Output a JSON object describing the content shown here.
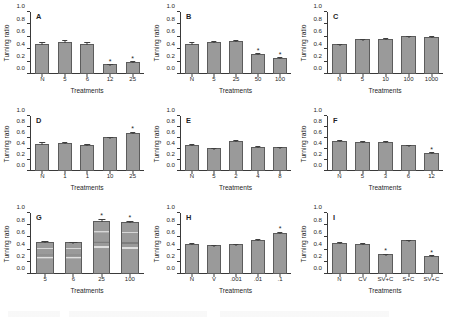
{
  "figure": {
    "y_axis_label": "Turning ratio",
    "x_axis_label": "Treatments",
    "y_ticks": [
      "0.0",
      "0.2",
      "0.4",
      "0.6",
      "0.8",
      "1.0"
    ],
    "bar_color": "#9a9a9a",
    "bar_edge_color": "#5c5c5c",
    "significance_marker": "*"
  },
  "chart_data": [
    {
      "type": "bar",
      "title": "A",
      "xlabel": "Treatments",
      "ylabel": "Turning ratio",
      "ylim": [
        0,
        1.0
      ],
      "grid": false,
      "categories": [
        "N",
        "5",
        "6",
        "12",
        "25"
      ],
      "values": [
        0.49,
        0.52,
        0.49,
        0.16,
        0.2
      ],
      "errors": [
        0.06,
        0.06,
        0.07,
        0.05,
        0.05
      ],
      "significant": [
        false,
        false,
        false,
        true,
        true
      ]
    },
    {
      "type": "bar",
      "title": "B",
      "xlabel": "Treatments",
      "ylabel": "Turning ratio",
      "ylim": [
        0,
        1.0
      ],
      "grid": false,
      "categories": [
        "N",
        "5",
        "25",
        "50",
        "100"
      ],
      "values": [
        0.49,
        0.51,
        0.53,
        0.32,
        0.26
      ],
      "errors": [
        0.05,
        0.04,
        0.05,
        0.04,
        0.05
      ],
      "significant": [
        false,
        false,
        false,
        true,
        true
      ]
    },
    {
      "type": "bar",
      "title": "C",
      "xlabel": "Treatments",
      "ylabel": "Turning ratio",
      "ylim": [
        0,
        1.0
      ],
      "grid": false,
      "categories": [
        "N",
        "5",
        "10",
        "100",
        "1000"
      ],
      "values": [
        0.48,
        0.56,
        0.57,
        0.61,
        0.6
      ],
      "errors": [
        0.01,
        0.02,
        0.02,
        0.01,
        0.01
      ],
      "significant": [
        false,
        false,
        false,
        false,
        false
      ]
    },
    {
      "type": "bar",
      "title": "D",
      "xlabel": "Treatments",
      "ylabel": "Turning ratio",
      "ylim": [
        0,
        1.0
      ],
      "grid": false,
      "categories": [
        "N",
        "1",
        "1",
        "10",
        "25"
      ],
      "values": [
        0.5,
        0.51,
        0.47,
        0.61,
        0.69
      ],
      "errors": [
        0.04,
        0.04,
        0.03,
        0.03,
        0.04
      ],
      "significant": [
        false,
        false,
        false,
        false,
        true
      ]
    },
    {
      "type": "bar",
      "title": "E",
      "xlabel": "Treatments",
      "ylabel": "Turning ratio",
      "ylim": [
        0,
        1.0
      ],
      "grid": false,
      "categories": [
        "N",
        "5",
        "2",
        "4",
        "8"
      ],
      "values": [
        0.48,
        0.42,
        0.55,
        0.44,
        0.43
      ],
      "errors": [
        0.02,
        0.01,
        0.02,
        0.02,
        0.01
      ],
      "significant": [
        false,
        false,
        false,
        false,
        false
      ]
    },
    {
      "type": "bar",
      "title": "F",
      "xlabel": "Treatments",
      "ylabel": "Turning ratio",
      "ylim": [
        0,
        1.0
      ],
      "grid": false,
      "categories": [
        "N",
        "5",
        "3",
        "6",
        "12"
      ],
      "values": [
        0.55,
        0.53,
        0.53,
        0.47,
        0.33
      ],
      "errors": [
        0.03,
        0.02,
        0.02,
        0.02,
        0.04
      ],
      "significant": [
        false,
        false,
        false,
        false,
        true
      ]
    },
    {
      "type": "bar",
      "title": "G",
      "xlabel": "Treatments",
      "ylabel": "Turning ratio",
      "ylim": [
        0,
        1.0
      ],
      "grid": false,
      "categories": [
        "5",
        "6",
        "25",
        "100"
      ],
      "values": [
        0.53,
        0.52,
        0.87,
        0.85
      ],
      "errors": [
        0.02,
        0.02,
        0.03,
        0.03
      ],
      "significant": [
        false,
        false,
        true,
        true
      ]
    },
    {
      "type": "bar",
      "title": "H",
      "xlabel": "Treatments",
      "ylabel": "Turning ratio",
      "ylim": [
        0,
        1.0
      ],
      "grid": false,
      "categories": [
        "N",
        "V",
        ".001",
        ".01",
        ".1"
      ],
      "values": [
        0.49,
        0.47,
        0.49,
        0.55,
        0.67
      ],
      "errors": [
        0.04,
        0.02,
        0.02,
        0.04,
        0.04
      ],
      "significant": [
        false,
        false,
        false,
        false,
        true
      ]
    },
    {
      "type": "bar",
      "title": "I",
      "xlabel": "Treatments",
      "ylabel": "Turning ratio",
      "ylim": [
        0,
        1.0
      ],
      "grid": false,
      "categories": [
        "N",
        "CV",
        "SV+C",
        "S+C",
        "SV+C"
      ],
      "values": [
        0.51,
        0.5,
        0.32,
        0.55,
        0.3
      ],
      "errors": [
        0.04,
        0.03,
        0.04,
        0.02,
        0.05
      ],
      "significant": [
        false,
        false,
        true,
        false,
        true
      ]
    }
  ]
}
